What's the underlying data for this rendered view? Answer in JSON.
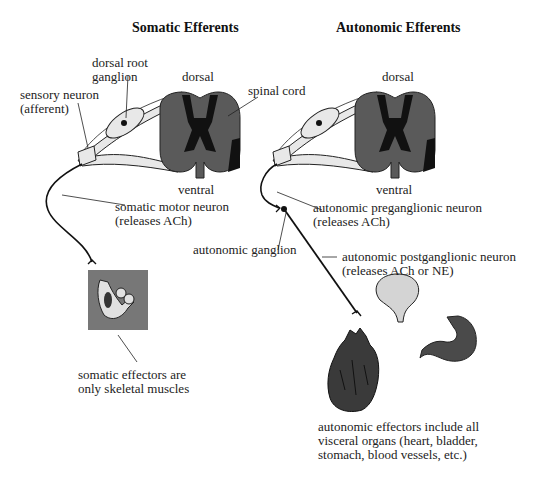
{
  "titles": {
    "somatic": "Somatic Efferents",
    "autonomic": "Autonomic Efferents"
  },
  "somatic": {
    "dorsal_root_ganglion": [
      "dorsal root",
      "ganglion"
    ],
    "sensory_neuron": [
      "sensory neuron",
      "(afferent)"
    ],
    "dorsal": "dorsal",
    "ventral": "ventral",
    "spinal_cord": "spinal cord",
    "motor_neuron": [
      "somatic motor neuron",
      "(releases ACh)"
    ],
    "effectors": [
      "somatic effectors are",
      "only skeletal muscles"
    ]
  },
  "autonomic": {
    "dorsal": "dorsal",
    "ventral": "ventral",
    "preganglionic": [
      "autonomic preganglionic neuron",
      "(releases ACh)"
    ],
    "ganglion": "autonomic ganglion",
    "postganglionic": [
      "autonomic postganglionic neuron",
      "(releases ACh or NE)"
    ],
    "effectors": [
      "autonomic effectors include all",
      "visceral organs (heart, bladder,",
      "stomach, blood vessels, etc.)"
    ]
  },
  "colors": {
    "cord_white_matter": "#5a5a5a",
    "cord_gray_matter": "#111111",
    "nerve_fill": "#e8e8e8",
    "muscle_box": "#777777",
    "bladder": "#d4d4d4",
    "organ_dark": "#4a4a4a"
  }
}
